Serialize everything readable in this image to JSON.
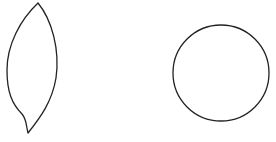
{
  "canvas": {
    "width": 276,
    "height": 142,
    "background": "#ffffff"
  },
  "shapes": [
    {
      "id": "leaf",
      "type": "leaf-outline",
      "stroke": "#222222",
      "fill": "none"
    },
    {
      "id": "circle",
      "type": "circle-outline",
      "cx": 221,
      "cy": 73,
      "r": 48,
      "stroke": "#222222",
      "fill": "none"
    }
  ]
}
